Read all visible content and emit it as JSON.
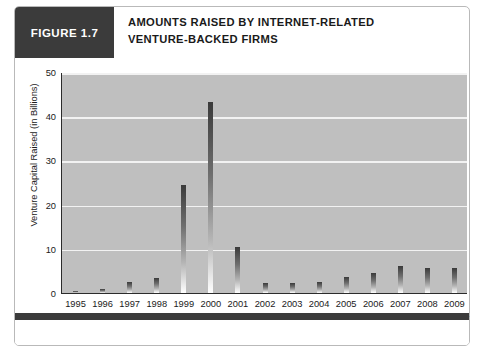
{
  "figure": {
    "tag": "FIGURE 1.7",
    "title_line1": "AMOUNTS RAISED BY INTERNET-RELATED",
    "title_line2": "VENTURE-BACKED FIRMS",
    "tag_bg": "#3b3b3b",
    "plot_bg": "#bfbfbf",
    "grid_color": "#f2f2f2",
    "bar_color_top": "#3a3a3a",
    "bar_color_bottom": "#ffffff"
  },
  "chart_data": {
    "type": "bar",
    "title": "AMOUNTS RAISED BY INTERNET-RELATED VENTURE-BACKED FIRMS",
    "xlabel": "Year",
    "ylabel": "Venture Capital Raised (in Billions)",
    "categories": [
      "1995",
      "1996",
      "1997",
      "1998",
      "1999",
      "2000",
      "2001",
      "2002",
      "2003",
      "2004",
      "2005",
      "2006",
      "2007",
      "2008",
      "2009"
    ],
    "values": [
      0.5,
      1.0,
      2.5,
      3.5,
      24.5,
      43.2,
      10.4,
      2.3,
      2.3,
      2.6,
      3.6,
      4.5,
      6.0,
      5.6,
      5.7
    ],
    "ylim": [
      0,
      50
    ],
    "yticks": [
      0,
      10,
      20,
      30,
      40,
      50
    ],
    "ytick_labels": [
      "0",
      "10",
      "20",
      "30",
      "40",
      "50"
    ],
    "grid": true,
    "legend": false
  }
}
